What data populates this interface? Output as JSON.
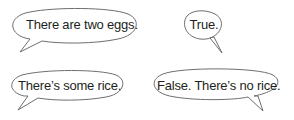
{
  "bubbles": [
    {
      "text": "There are two eggs.",
      "tail": "bottom-left"
    },
    {
      "text": "True.",
      "tail": "bottom-right"
    },
    {
      "text": "There’s some rice.",
      "tail": "bottom-left"
    },
    {
      "text": "False. There’s no rice.",
      "tail": "bottom-right"
    }
  ],
  "colors": {
    "outline": "#6d6e71",
    "text": "#231f20",
    "fill": "#ffffff"
  }
}
